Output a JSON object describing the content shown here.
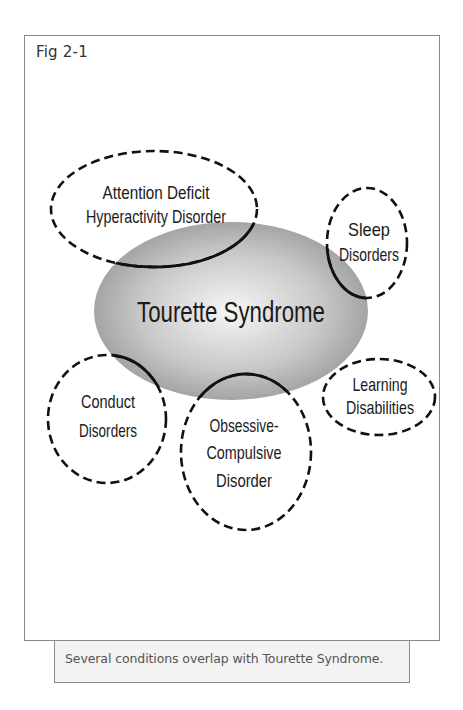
{
  "figure": {
    "label": "Fig 2-1",
    "caption": "Several conditions overlap with Tourette Syndrome."
  },
  "diagram": {
    "central": {
      "label": "Tourette Syndrome",
      "fill": "gradient-gray",
      "colors": {
        "center": "#f4f4f4",
        "edge": "#9a9a9a"
      }
    },
    "conditions": [
      {
        "id": "adhd",
        "lines": [
          "Attention Deficit",
          "Hyperactivity Disorder"
        ],
        "border": "dashed"
      },
      {
        "id": "sleep",
        "lines": [
          "Sleep",
          "Disorders"
        ],
        "border": "dashed"
      },
      {
        "id": "learning",
        "lines": [
          "Learning",
          "Disabilities"
        ],
        "border": "dashed"
      },
      {
        "id": "conduct",
        "lines": [
          "Conduct",
          "Disorders"
        ],
        "border": "dashed"
      },
      {
        "id": "ocd",
        "lines": [
          "Obsessive-",
          "Compulsive",
          "Disorder"
        ],
        "border": "dashed"
      }
    ],
    "overlap_style": "solid line inside central ellipse"
  }
}
